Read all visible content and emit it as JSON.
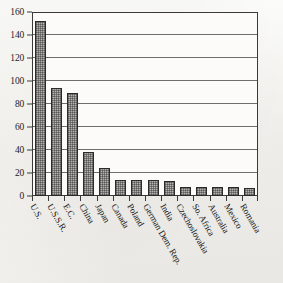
{
  "chart_data": {
    "type": "bar",
    "title": "",
    "subtitle": "",
    "xlabel": "",
    "ylabel": "",
    "ylim": [
      0,
      160
    ],
    "ytick_step": 20,
    "yticks": [
      0,
      20,
      40,
      60,
      80,
      100,
      120,
      140,
      160
    ],
    "ytick_labels": [
      "0",
      "20",
      "40",
      "60",
      "80",
      "100",
      "120",
      "140",
      "160"
    ],
    "grid": true,
    "legend": false,
    "legend_position": "none",
    "xtick_rotation_degrees": 60,
    "bar_fill_style": "stippled-gray",
    "categories": [
      "U.S.",
      "U.S.S.R.",
      "E.C.",
      "China",
      "Japan",
      "Canada",
      "Poland",
      "German Dem. Rep.",
      "India",
      "Czechoslovakia",
      "So. Africa",
      "Australia",
      "Mexico",
      "Romania"
    ],
    "values": [
      152,
      94,
      90,
      38,
      24,
      14,
      14,
      14,
      13,
      8,
      8,
      8,
      8,
      7
    ]
  },
  "colors": {
    "background": "#f7f6f3",
    "plot_background": "#fcfbf9",
    "axis": "#3a3a3a",
    "gridline": "#555555",
    "bar_fill": "#b4b2ae",
    "bar_outline": "#2a2a2a",
    "text": "#141414"
  }
}
